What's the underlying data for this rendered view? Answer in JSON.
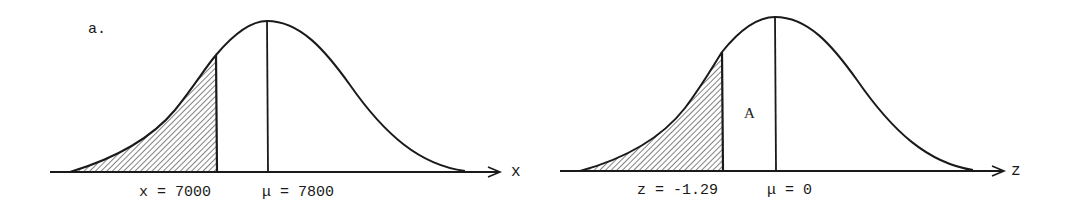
{
  "figure": {
    "panel_label": "a.",
    "ink_color": "#1a1a1a",
    "background": "#ffffff"
  },
  "left_curve": {
    "axis_variable": "x",
    "cut_label": "x = 7000",
    "mean_label": "μ = 7800",
    "cut_value": 7000,
    "mean_value": 7800,
    "shaded_region": "left tail below x = 7000"
  },
  "right_curve": {
    "axis_variable": "z",
    "cut_label": "z = -1.29",
    "mean_label": "μ = 0",
    "cut_value": -1.29,
    "mean_value": 0,
    "area_label": "A",
    "shaded_region": "left tail below z = -1.29"
  }
}
